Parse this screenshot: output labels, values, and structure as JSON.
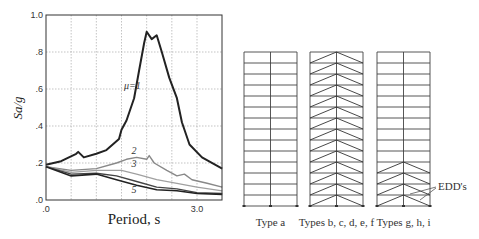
{
  "chart_data": {
    "type": "line",
    "title": "",
    "xlabel": "Period, s",
    "ylabel": "Sa/g",
    "xlim": [
      0,
      3.5
    ],
    "ylim": [
      0,
      1.0
    ],
    "grid": true,
    "x_tick_labels": [
      ".0",
      "3.0"
    ],
    "x_ticks": [
      0,
      3.0
    ],
    "x_gridlines": [
      0.5,
      1.0,
      1.5,
      2.0,
      2.5,
      3.0
    ],
    "y_tick_labels": [
      ".0",
      ".2",
      ".4",
      ".6",
      ".8",
      "1.0"
    ],
    "y_ticks": [
      0,
      0.2,
      0.4,
      0.6,
      0.8,
      1.0
    ],
    "series": [
      {
        "name": "μ=1",
        "label": "μ=1",
        "color": "#222222",
        "width": 2.0,
        "label_pos": [
          1.55,
          0.6
        ],
        "points": [
          [
            0,
            0.19
          ],
          [
            0.3,
            0.21
          ],
          [
            0.6,
            0.25
          ],
          [
            0.64,
            0.26
          ],
          [
            0.75,
            0.23
          ],
          [
            1.0,
            0.25
          ],
          [
            1.2,
            0.27
          ],
          [
            1.45,
            0.33
          ],
          [
            1.5,
            0.38
          ],
          [
            1.6,
            0.43
          ],
          [
            1.75,
            0.55
          ],
          [
            1.85,
            0.7
          ],
          [
            1.95,
            0.85
          ],
          [
            2.0,
            0.91
          ],
          [
            2.1,
            0.87
          ],
          [
            2.2,
            0.89
          ],
          [
            2.3,
            0.8
          ],
          [
            2.45,
            0.66
          ],
          [
            2.6,
            0.55
          ],
          [
            2.7,
            0.42
          ],
          [
            2.85,
            0.3
          ],
          [
            3.1,
            0.23
          ],
          [
            3.5,
            0.17
          ]
        ]
      },
      {
        "name": "μ=2",
        "label": "2",
        "color": "#888888",
        "width": 1.4,
        "label_pos": [
          1.7,
          0.25
        ],
        "points": [
          [
            0,
            0.18
          ],
          [
            0.5,
            0.16
          ],
          [
            1.0,
            0.17
          ],
          [
            1.4,
            0.2
          ],
          [
            1.6,
            0.22
          ],
          [
            1.8,
            0.23
          ],
          [
            2.0,
            0.22
          ],
          [
            2.05,
            0.24
          ],
          [
            2.15,
            0.2
          ],
          [
            2.4,
            0.16
          ],
          [
            2.6,
            0.13
          ],
          [
            2.75,
            0.14
          ],
          [
            2.9,
            0.11
          ],
          [
            3.2,
            0.09
          ],
          [
            3.5,
            0.07
          ]
        ]
      },
      {
        "name": "μ=3",
        "label": "3",
        "color": "#a0a0a0",
        "width": 1.2,
        "label_pos": [
          1.7,
          0.18
        ],
        "points": [
          [
            0,
            0.18
          ],
          [
            0.5,
            0.15
          ],
          [
            1.0,
            0.16
          ],
          [
            1.5,
            0.16
          ],
          [
            1.8,
            0.14
          ],
          [
            2.2,
            0.11
          ],
          [
            2.6,
            0.09
          ],
          [
            3.0,
            0.07
          ],
          [
            3.5,
            0.05
          ]
        ]
      },
      {
        "name": "μ=4",
        "label": "",
        "color": "#444444",
        "width": 1.4,
        "label_pos": null,
        "points": [
          [
            0,
            0.18
          ],
          [
            0.5,
            0.14
          ],
          [
            1.0,
            0.145
          ],
          [
            1.4,
            0.13
          ],
          [
            1.8,
            0.1
          ],
          [
            2.2,
            0.07
          ],
          [
            2.6,
            0.06
          ],
          [
            3.0,
            0.04
          ],
          [
            3.5,
            0.035
          ]
        ]
      },
      {
        "name": "μ=5",
        "label": "5",
        "color": "#222222",
        "width": 1.6,
        "label_pos": [
          1.7,
          0.04
        ],
        "points": [
          [
            0,
            0.18
          ],
          [
            0.5,
            0.13
          ],
          [
            1.0,
            0.14
          ],
          [
            1.4,
            0.11
          ],
          [
            1.8,
            0.08
          ],
          [
            2.2,
            0.055
          ],
          [
            2.6,
            0.05
          ],
          [
            3.0,
            0.035
          ],
          [
            3.5,
            0.03
          ]
        ]
      }
    ]
  },
  "frames": {
    "stories": 14,
    "items": [
      {
        "name": "type-a",
        "label": "Type a",
        "braced_stories": 0
      },
      {
        "name": "types-b-f",
        "label": "Types b, c, d, e, f",
        "braced_stories": 14
      },
      {
        "name": "types-g-i",
        "label": "Types g, h, i",
        "braced_stories": 4
      }
    ],
    "annotation": "EDD's"
  }
}
